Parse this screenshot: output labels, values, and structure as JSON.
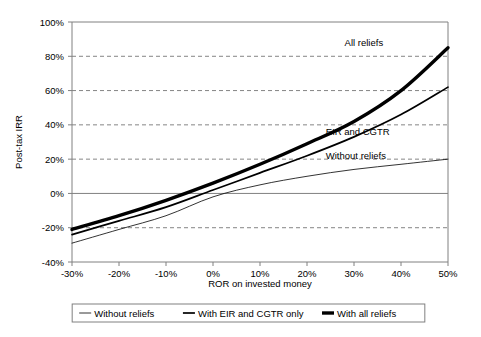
{
  "chart_data": {
    "type": "line",
    "title": "",
    "xlabel": "ROR on invested money",
    "ylabel": "Post-tax IRR",
    "xlim": [
      -30,
      50
    ],
    "ylim": [
      -40,
      100
    ],
    "xticks": [
      "-30%",
      "-20%",
      "-10%",
      "0%",
      "10%",
      "20%",
      "30%",
      "40%",
      "50%"
    ],
    "xtick_values": [
      -30,
      -20,
      -10,
      0,
      10,
      20,
      30,
      40,
      50
    ],
    "yticks": [
      "-40%",
      "-20%",
      "0%",
      "20%",
      "40%",
      "60%",
      "80%",
      "100%"
    ],
    "ytick_values": [
      -40,
      -20,
      0,
      20,
      40,
      60,
      80,
      100
    ],
    "grid": "horizontal-dashed",
    "legend_position": "bottom",
    "x": [
      -30,
      -20,
      -10,
      0,
      10,
      20,
      30,
      40,
      50
    ],
    "series": [
      {
        "name": "Without reliefs",
        "legend_label": "Without reliefs",
        "annotation": "Without reliefs",
        "annotation_x": 24,
        "annotation_y": 22,
        "values": [
          -29,
          -21,
          -13,
          -2,
          5,
          10,
          14,
          17,
          20
        ],
        "line_width": 0.8,
        "color": "#000000"
      },
      {
        "name": "With EIR and CGTR only",
        "legend_label": "With EIR and CGTR only",
        "annotation": "EIR and CGTR",
        "annotation_x": 24,
        "annotation_y": 36,
        "values": [
          -24,
          -16,
          -8,
          2,
          12,
          22,
          33,
          46,
          62
        ],
        "line_width": 1.7,
        "color": "#000000"
      },
      {
        "name": "With all reliefs",
        "legend_label": "With all reliefs",
        "annotation": "All reliefs",
        "annotation_x": 28,
        "annotation_y": 88,
        "values": [
          -21,
          -13,
          -4,
          6,
          17,
          29,
          42,
          60,
          85
        ],
        "line_width": 3.4,
        "color": "#000000"
      }
    ],
    "zero_line": 0,
    "legend": [
      {
        "label": "Without reliefs",
        "line_width": 0.8
      },
      {
        "label": "With EIR and CGTR only",
        "line_width": 1.7
      },
      {
        "label": "With all reliefs",
        "line_width": 3.4
      }
    ],
    "colors": {
      "line": "#000000",
      "axis": "#808080",
      "grid": "#666666",
      "background": "#ffffff"
    }
  }
}
